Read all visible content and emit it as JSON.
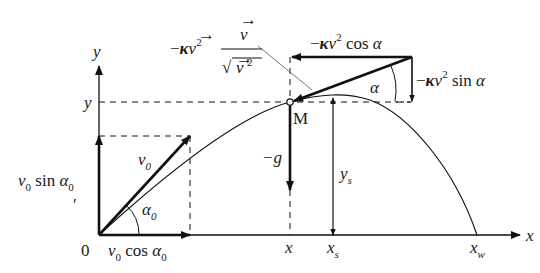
{
  "diagram": {
    "axes": {
      "x_label": "x",
      "y_label": "y",
      "origin_label": "0"
    },
    "points": {
      "M_label": "M"
    },
    "axis_ticks": {
      "x_point": "x",
      "x_s": "x",
      "x_s_sub": "s",
      "x_w": "x",
      "x_w_sub": "w",
      "y_point": "y"
    },
    "initial_velocity": {
      "v0_label": "v",
      "v0_sub": "0",
      "alpha0_label": "α",
      "alpha0_sub": "0",
      "vertical_component": {
        "v": "v",
        "sub": "0",
        "func": " sin ",
        "alpha": "α",
        "alpha_sub": "0"
      },
      "horizontal_component": {
        "v": "v",
        "sub": "0",
        "func": " cos ",
        "alpha": "α",
        "alpha_sub": "0"
      }
    },
    "forces": {
      "gravity": "−g",
      "drag_vector": {
        "prefix": "−",
        "kappa": "κ",
        "v": "v",
        "exp": "2",
        "numerator": "v",
        "denominator_root": "√",
        "denominator_v": "v",
        "denominator_exp": "2"
      },
      "drag_horizontal": {
        "prefix": "−",
        "kappa": "κ",
        "v": "v",
        "exp": "2",
        "func": " cos ",
        "alpha": "α"
      },
      "drag_vertical": {
        "prefix": "−",
        "kappa": "κ",
        "v": "v",
        "exp": "2",
        "func": " sin ",
        "alpha": "α"
      },
      "alpha_label": "α"
    },
    "height": {
      "y_s": "y",
      "y_s_sub": "s"
    },
    "stray_mark": "ʹ"
  }
}
